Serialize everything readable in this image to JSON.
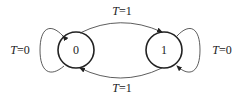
{
  "diagram": {
    "type": "state-diagram",
    "states": [
      {
        "id": "s0",
        "label": "0"
      },
      {
        "id": "s1",
        "label": "1"
      }
    ],
    "transitions": [
      {
        "from": "0",
        "to": "1",
        "label": "T=1",
        "var": "T",
        "val": "=1"
      },
      {
        "from": "1",
        "to": "0",
        "label": "T=1",
        "var": "T",
        "val": "=1"
      },
      {
        "from": "0",
        "to": "0",
        "label": "T=0",
        "var": "T",
        "val": "=0"
      },
      {
        "from": "1",
        "to": "1",
        "label": "T=0",
        "var": "T",
        "val": "=0"
      }
    ]
  }
}
